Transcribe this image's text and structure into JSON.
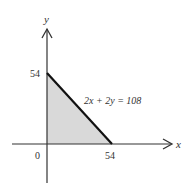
{
  "diagram": {
    "type": "coordinate-plot",
    "axes": {
      "x_label": "x",
      "y_label": "y",
      "origin_label": "0"
    },
    "ticks": {
      "y_intercept_label": "54",
      "x_intercept_label": "54"
    },
    "line": {
      "equation": "2x + 2y = 108",
      "from": [
        0,
        54
      ],
      "to": [
        54,
        0
      ]
    },
    "region": {
      "shape": "triangle",
      "vertices": [
        [
          0,
          0
        ],
        [
          0,
          54
        ],
        [
          54,
          0
        ]
      ],
      "fill": "#d9d9d9"
    },
    "colors": {
      "axis": "#333333",
      "line": "#111111",
      "fill": "#d9d9d9"
    }
  }
}
